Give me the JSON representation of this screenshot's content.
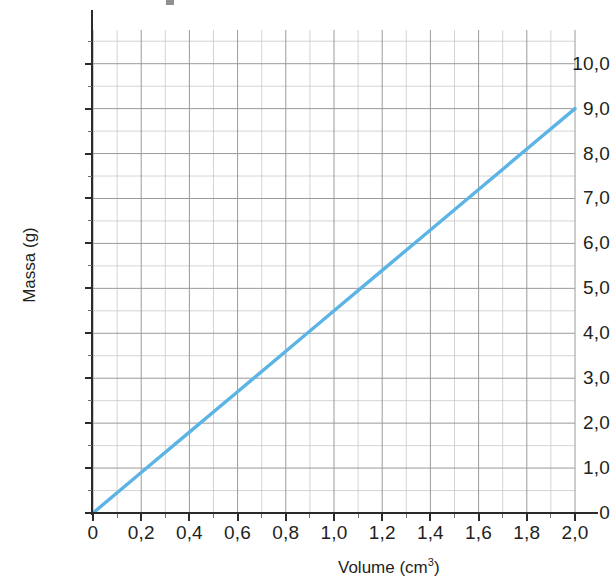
{
  "chart_data": {
    "type": "line",
    "title": "",
    "xlabel": "Volume (cm3)",
    "xlabel_base": "Volume (cm",
    "xlabel_sup": "3",
    "xlabel_close": ")",
    "ylabel": "Massa (g)",
    "xlim": [
      0,
      2.0
    ],
    "ylim": [
      0,
      10.75
    ],
    "x_tick_labels": [
      "0",
      "0,2",
      "0,4",
      "0,6",
      "0,8",
      "1,0",
      "1,2",
      "1,4",
      "1,6",
      "1,8",
      "2,0"
    ],
    "x_tick_values": [
      0,
      0.2,
      0.4,
      0.6,
      0.8,
      1.0,
      1.2,
      1.4,
      1.6,
      1.8,
      2.0
    ],
    "y_tick_labels": [
      "0",
      "1,0",
      "2,0",
      "3,0",
      "4,0",
      "5,0",
      "6,0",
      "7,0",
      "8,0",
      "9,0",
      "10,0"
    ],
    "y_tick_values": [
      0,
      1,
      2,
      3,
      4,
      5,
      6,
      7,
      8,
      9,
      10
    ],
    "x_minor_step": 0.1,
    "y_minor_step": 0.5,
    "grid": true,
    "legend": "none",
    "decimal_separator": ",",
    "series": [
      {
        "name": "Massa x Volume",
        "color": "#5BB4E5",
        "width": 3.4,
        "points": [
          {
            "x": 0.0,
            "y": 0.0
          },
          {
            "x": 0.2,
            "y": 0.9
          },
          {
            "x": 0.4,
            "y": 1.8
          },
          {
            "x": 0.6,
            "y": 2.7
          },
          {
            "x": 0.8,
            "y": 3.6
          },
          {
            "x": 1.0,
            "y": 4.5
          },
          {
            "x": 1.2,
            "y": 5.4
          },
          {
            "x": 1.4,
            "y": 6.3
          },
          {
            "x": 1.6,
            "y": 7.2
          },
          {
            "x": 1.8,
            "y": 8.1
          },
          {
            "x": 2.0,
            "y": 9.0
          }
        ],
        "slope": 4.5,
        "intercept": 0
      }
    ],
    "colors": {
      "line": "#5BB4E5",
      "axis": "#2b2b2b",
      "grid_major": "#9a9a9a",
      "grid_minor": "#c9c9c9",
      "text": "#231f20",
      "background": "#ffffff"
    }
  }
}
